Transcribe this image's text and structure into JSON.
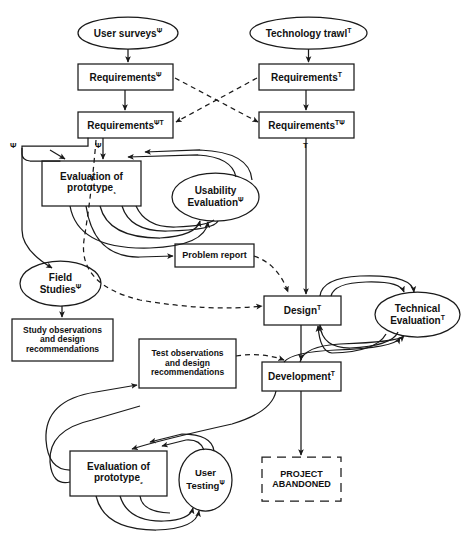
{
  "diagram": {
    "symbols": {
      "psi": "Ψ",
      "tau": "T",
      "sub1": "₁",
      "sub2": "₂"
    },
    "colors": {
      "stroke": "#1a1a1a",
      "text": "#111111",
      "background": "#ffffff"
    },
    "nodes": [
      {
        "id": "user-surveys",
        "shape": "ellipse",
        "label": "User surveys",
        "sup": "Ψ",
        "x": 78,
        "y": 17,
        "w": 100,
        "h": 32,
        "font": 10
      },
      {
        "id": "technology-trawl",
        "shape": "ellipse",
        "label": "Technology trawl",
        "sup": "T",
        "x": 250,
        "y": 17,
        "w": 117,
        "h": 32,
        "font": 10
      },
      {
        "id": "requirements-psi",
        "shape": "rect",
        "label": "Requirements",
        "sup": "Ψ",
        "x": 78,
        "y": 64,
        "w": 95,
        "h": 26,
        "font": 10
      },
      {
        "id": "requirements-t",
        "shape": "rect",
        "label": "Requirements",
        "sup": "T",
        "x": 259,
        "y": 64,
        "w": 95,
        "h": 26,
        "font": 10
      },
      {
        "id": "requirements-psi-t",
        "shape": "rect",
        "label": "Requirements",
        "sup": "ΨT",
        "x": 78,
        "y": 112,
        "w": 95,
        "h": 26,
        "font": 10
      },
      {
        "id": "requirements-t-psi",
        "shape": "rect",
        "label": "Requirements",
        "sup": "TΨ",
        "x": 259,
        "y": 112,
        "w": 95,
        "h": 26,
        "font": 10
      },
      {
        "id": "evaluation-prototype-1",
        "shape": "rect",
        "label": "Evaluation of\nprototype",
        "sub": "₁",
        "x": 42,
        "y": 161,
        "w": 99,
        "h": 45,
        "font": 10
      },
      {
        "id": "usability-evaluation",
        "shape": "ellipse",
        "label": "Usability\nEvaluation",
        "sup": "Ψ",
        "x": 172,
        "y": 173,
        "w": 87,
        "h": 48,
        "font": 10
      },
      {
        "id": "problem-report",
        "shape": "rect",
        "label": "Problem report",
        "x": 175,
        "y": 244,
        "w": 79,
        "h": 23,
        "font": 9
      },
      {
        "id": "field-studies",
        "shape": "ellipse",
        "label": "Field\nStudies",
        "sup": "Ψ",
        "x": 20,
        "y": 261,
        "w": 81,
        "h": 45,
        "font": 10
      },
      {
        "id": "study-observations",
        "shape": "rect",
        "label": "Study observations\nand design\nrecommendations",
        "x": 12,
        "y": 319,
        "w": 101,
        "h": 42,
        "font": 8.5
      },
      {
        "id": "design",
        "shape": "rect",
        "label": "Design",
        "sup": "T",
        "x": 264,
        "y": 296,
        "w": 77,
        "h": 29,
        "font": 10
      },
      {
        "id": "technical-evaluation",
        "shape": "ellipse",
        "label": "Technical\nEvaluation",
        "sup": "T",
        "x": 375,
        "y": 292,
        "w": 85,
        "h": 45,
        "font": 10
      },
      {
        "id": "test-observations",
        "shape": "rect",
        "label": "Test observations\nand design\nrecommendations",
        "x": 139,
        "y": 339,
        "w": 97,
        "h": 49,
        "font": 8.5
      },
      {
        "id": "development",
        "shape": "rect",
        "label": "Development",
        "sup": "T",
        "x": 262,
        "y": 362,
        "w": 79,
        "h": 29,
        "font": 10
      },
      {
        "id": "evaluation-prototype-2",
        "shape": "rect",
        "label": "Evaluation of\nprototype",
        "sub": "₂",
        "x": 70,
        "y": 451,
        "w": 97,
        "h": 45,
        "font": 10
      },
      {
        "id": "user-testing",
        "shape": "ellipse",
        "label": "User\nTesting",
        "sup": "Ψ",
        "x": 179,
        "y": 449,
        "w": 53,
        "h": 62,
        "font": 9.5
      },
      {
        "id": "project-abandoned",
        "shape": "rect-dashed",
        "label": "PROJECT\nABANDONED",
        "x": 262,
        "y": 457,
        "w": 79,
        "h": 44,
        "font": 9
      }
    ],
    "edge_labels": [
      {
        "id": "psi-left",
        "text": "Ψ",
        "x": 10,
        "y": 141
      },
      {
        "id": "psi-mid",
        "text": "Ψ",
        "x": 95,
        "y": 141
      },
      {
        "id": "t-right",
        "text": "T",
        "x": 303,
        "y": 141
      }
    ],
    "edges": [
      {
        "from": "user-surveys",
        "to": "requirements-psi",
        "style": "solid"
      },
      {
        "from": "technology-trawl",
        "to": "requirements-t",
        "style": "solid"
      },
      {
        "from": "requirements-psi",
        "to": "requirements-psi-t",
        "style": "solid"
      },
      {
        "from": "requirements-t",
        "to": "requirements-t-psi",
        "style": "solid"
      },
      {
        "from": "requirements-psi",
        "to": "requirements-t-psi",
        "style": "dashed"
      },
      {
        "from": "requirements-t",
        "to": "requirements-psi-t",
        "style": "dashed"
      },
      {
        "from": "requirements-psi-t",
        "to": "evaluation-prototype-1",
        "style": "solid"
      },
      {
        "from": "requirements-psi-t",
        "to": "field-studies",
        "style": "solid"
      },
      {
        "from": "requirements-psi-t",
        "to": "design",
        "style": "dashed"
      },
      {
        "from": "requirements-t-psi",
        "to": "design",
        "style": "solid"
      },
      {
        "from": "evaluation-prototype-1",
        "to": "usability-evaluation",
        "style": "solid"
      },
      {
        "from": "usability-evaluation",
        "to": "evaluation-prototype-1",
        "style": "solid"
      },
      {
        "from": "evaluation-prototype-1",
        "to": "problem-report",
        "style": "solid"
      },
      {
        "from": "problem-report",
        "to": "design",
        "style": "dashed"
      },
      {
        "from": "field-studies",
        "to": "study-observations",
        "style": "solid"
      },
      {
        "from": "design",
        "to": "technical-evaluation",
        "style": "solid"
      },
      {
        "from": "technical-evaluation",
        "to": "design",
        "style": "solid"
      },
      {
        "from": "design",
        "to": "development",
        "style": "solid"
      },
      {
        "from": "development",
        "to": "technical-evaluation",
        "style": "solid"
      },
      {
        "from": "test-observations",
        "to": "development",
        "style": "dashed"
      },
      {
        "from": "development",
        "to": "evaluation-prototype-2",
        "style": "solid"
      },
      {
        "from": "development",
        "to": "project-abandoned",
        "style": "solid"
      },
      {
        "from": "evaluation-prototype-2",
        "to": "user-testing",
        "style": "solid"
      },
      {
        "from": "user-testing",
        "to": "evaluation-prototype-2",
        "style": "solid"
      },
      {
        "from": "evaluation-prototype-2",
        "to": "test-observations",
        "style": "solid"
      }
    ]
  }
}
